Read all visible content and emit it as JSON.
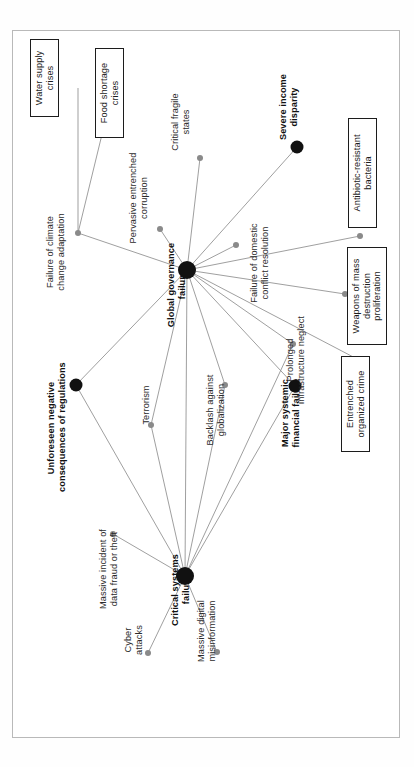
{
  "figure": {
    "kind": "risk-interconnections-network",
    "orientation": "rotated-90-counterclockwise",
    "frame_color": "#b9b9b9",
    "edge_color": "#8e8e8e",
    "hub_color": "#111111",
    "dot_color": "#8a8a8a"
  },
  "nodes": [
    {
      "id": "water_supply",
      "label": "Water supply\ncrises",
      "kind": "boxed",
      "x": 78,
      "y": 88,
      "lx": 30,
      "ly": 117,
      "w": 66,
      "r": 0
    },
    {
      "id": "food_shortage",
      "label": "Food shortage\ncrises",
      "kind": "boxed",
      "x": 105,
      "y": 122,
      "lx": 95,
      "ly": 138,
      "w": 78,
      "r": 0
    },
    {
      "id": "climate_adaptation",
      "label": "Failure of climate\nchange adaptation",
      "kind": "dot",
      "x": 78,
      "y": 233,
      "lx": 45,
      "ly": 298,
      "w": 92,
      "r": 3
    },
    {
      "id": "pervasive_corruption",
      "label": "Pervasive entrenched\ncorruption",
      "kind": "dot",
      "x": 160,
      "y": 229,
      "lx": 128,
      "ly": 250,
      "w": 104,
      "r": 3
    },
    {
      "id": "critical_fragile",
      "label": "Critical fragile\nstates",
      "kind": "dot",
      "x": 200,
      "y": 158,
      "lx": 170,
      "ly": 160,
      "w": 76,
      "r": 3
    },
    {
      "id": "global_governance",
      "label": "Global governance\nfailure",
      "kind": "hub",
      "x": 187,
      "y": 270,
      "lx": 166,
      "ly": 332,
      "w": 94,
      "r": 9
    },
    {
      "id": "severe_income",
      "label": "Severe income\ndisparity",
      "kind": "big",
      "x": 297,
      "y": 147,
      "lx": 278,
      "ly": 147,
      "w": 80,
      "r": 6.5
    },
    {
      "id": "domestic_conflict",
      "label": "Failure of domestic\nconflict resolution",
      "kind": "dot",
      "x": 236,
      "y": 245,
      "lx": 249,
      "ly": 312,
      "w": 98,
      "r": 3
    },
    {
      "id": "antibiotic",
      "label": "Antibiotic-resistant\nbacteria",
      "kind": "boxed",
      "x": 360,
      "y": 236,
      "lx": 348,
      "ly": 228,
      "w": 98,
      "r": 3
    },
    {
      "id": "wmd",
      "label": "Weapons of mass\ndestruction\nproliferation",
      "kind": "boxed",
      "x": 345,
      "y": 294,
      "lx": 347,
      "ly": 345,
      "w": 86,
      "r": 3
    },
    {
      "id": "infrastructure",
      "label": "Prolonged\ninfrastructure neglect",
      "kind": "dot",
      "x": 293,
      "y": 344,
      "lx": 285,
      "ly": 408,
      "w": 96,
      "r": 3
    },
    {
      "id": "organized_crime",
      "label": "Entrenched\norganized crime",
      "kind": "boxed",
      "x": 359,
      "y": 360,
      "lx": 341,
      "ly": 452,
      "w": 84,
      "r": 3
    },
    {
      "id": "unforeseen_reg",
      "label": "Unforeseen negative\nconsequences of regulations",
      "kind": "big",
      "x": 76,
      "y": 385,
      "lx": 46,
      "ly": 492,
      "w": 128,
      "r": 6.5
    },
    {
      "id": "terrorism",
      "label": "Terrorism",
      "kind": "dot",
      "x": 151,
      "y": 425,
      "lx": 141,
      "ly": 432,
      "w": 54,
      "r": 3
    },
    {
      "id": "backlash",
      "label": "Backlash against\nglobalization",
      "kind": "dot",
      "x": 225,
      "y": 385,
      "lx": 205,
      "ly": 452,
      "w": 84,
      "r": 3
    },
    {
      "id": "financial_failure",
      "label": "Major systemic\nfinancial failure",
      "kind": "big",
      "x": 295,
      "y": 386,
      "lx": 280,
      "ly": 455,
      "w": 84,
      "r": 6.5
    },
    {
      "id": "data_fraud",
      "label": "Massive incident of\ndata fraud or theft",
      "kind": "dot",
      "x": 113,
      "y": 534,
      "lx": 98,
      "ly": 616,
      "w": 94,
      "r": 3
    },
    {
      "id": "critical_systems",
      "label": "Critical systems\nfailure",
      "kind": "hub",
      "x": 185,
      "y": 576,
      "lx": 170,
      "ly": 633,
      "w": 86,
      "r": 9
    },
    {
      "id": "cyber_attacks",
      "label": "Cyber\nattacks",
      "kind": "dot",
      "x": 148,
      "y": 653,
      "lx": 123,
      "ly": 666,
      "w": 52,
      "r": 3
    },
    {
      "id": "digital_misinfo",
      "label": "Massive digital\nmisinformation",
      "kind": "dot",
      "x": 217,
      "y": 652,
      "lx": 196,
      "ly": 672,
      "w": 82,
      "r": 3
    }
  ],
  "edges": [
    {
      "from": "water_supply",
      "to": "climate_adaptation"
    },
    {
      "from": "food_shortage",
      "to": "climate_adaptation"
    },
    {
      "from": "climate_adaptation",
      "to": "global_governance"
    },
    {
      "from": "pervasive_corruption",
      "to": "global_governance"
    },
    {
      "from": "critical_fragile",
      "to": "global_governance"
    },
    {
      "from": "severe_income",
      "to": "global_governance"
    },
    {
      "from": "domestic_conflict",
      "to": "global_governance"
    },
    {
      "from": "antibiotic",
      "to": "global_governance"
    },
    {
      "from": "wmd",
      "to": "global_governance"
    },
    {
      "from": "infrastructure",
      "to": "global_governance"
    },
    {
      "from": "organized_crime",
      "to": "global_governance"
    },
    {
      "from": "unforeseen_reg",
      "to": "global_governance"
    },
    {
      "from": "terrorism",
      "to": "global_governance"
    },
    {
      "from": "backlash",
      "to": "global_governance"
    },
    {
      "from": "financial_failure",
      "to": "global_governance"
    },
    {
      "from": "unforeseen_reg",
      "to": "critical_systems"
    },
    {
      "from": "terrorism",
      "to": "critical_systems"
    },
    {
      "from": "backlash",
      "to": "critical_systems"
    },
    {
      "from": "infrastructure",
      "to": "critical_systems"
    },
    {
      "from": "financial_failure",
      "to": "critical_systems"
    },
    {
      "from": "data_fraud",
      "to": "critical_systems"
    },
    {
      "from": "cyber_attacks",
      "to": "critical_systems"
    },
    {
      "from": "digital_misinfo",
      "to": "critical_systems"
    },
    {
      "from": "global_governance",
      "to": "critical_systems"
    }
  ]
}
